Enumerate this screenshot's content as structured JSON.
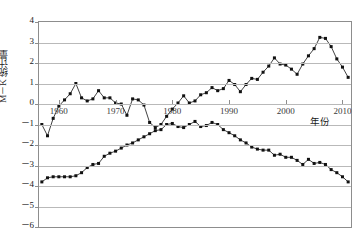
{
  "chart_data": {
    "type": "line",
    "title": "",
    "xlabel": "年份",
    "ylabel": "M－K 统计量",
    "xlim": [
      1956.5,
      2011.5
    ],
    "ylim": [
      -6,
      4
    ],
    "xticks": [
      1960,
      1970,
      1980,
      1990,
      2000,
      2010
    ],
    "xticklabels": [
      "1960",
      "1970",
      "1980",
      "1990",
      "2000",
      "2010"
    ],
    "yticks": [
      4,
      3,
      2,
      1,
      0,
      -1,
      -2,
      -3,
      -4,
      -5,
      -6
    ],
    "yticklabels": [
      "4",
      "3",
      "2",
      "1",
      "0",
      "－1",
      "－2",
      "－3",
      "－4",
      "－5",
      "－6"
    ],
    "grid": true,
    "grid_axis": "y",
    "legend": "none",
    "marker": "filled-square",
    "series": [
      {
        "name": "UF",
        "x": [
          1957,
          1958,
          1959,
          1960,
          1961,
          1962,
          1963,
          1964,
          1965,
          1966,
          1967,
          1968,
          1969,
          1970,
          1971,
          1972,
          1973,
          1974,
          1975,
          1976,
          1977,
          1978,
          1979,
          1980,
          1981,
          1982,
          1983,
          1984,
          1985,
          1986,
          1987,
          1988,
          1989,
          1990,
          1991,
          1992,
          1993,
          1994,
          1995,
          1996,
          1997,
          1998,
          1999,
          2000,
          2001,
          2002,
          2003,
          2004,
          2005,
          2006,
          2007,
          2008,
          2009,
          2010,
          2011
        ],
        "values": [
          -1.0,
          -1.55,
          -0.7,
          -0.1,
          0.5,
          0.55,
          1.0,
          0.35,
          0.15,
          0.2,
          0.65,
          0.3,
          0.3,
          0.05,
          0.1,
          -0.55,
          0.25,
          0.2,
          -0.1,
          -0.75,
          -1.0,
          -1.15,
          -1.1,
          -1.15,
          -1.2,
          -1.0,
          -1.1,
          -1.3,
          -1.45,
          -1.2,
          -1.05,
          -1.0,
          -0.85,
          -0.7,
          -0.55,
          -0.45,
          -0.35,
          -0.25,
          -0.2,
          -0.1,
          0.05,
          0.2,
          0.35,
          0.45,
          0.6,
          0.7,
          0.8,
          0.95,
          1.05,
          1.15,
          1.2,
          1.3,
          1.4,
          1.5,
          1.6
        ]
      },
      {
        "name": "UB",
        "x": [
          1957,
          1958,
          1959,
          1960,
          1961,
          1962,
          1963,
          1964,
          1965,
          1966,
          1967,
          1968,
          1969,
          1970,
          1971,
          1972,
          1973,
          1974,
          1975,
          1976,
          1977,
          1978,
          1979,
          1980,
          1981,
          1982,
          1983,
          1984,
          1985,
          1986,
          1987,
          1988,
          1989,
          1990,
          1991,
          1992,
          1993,
          1994,
          1995,
          1996,
          1997,
          1998,
          1999,
          2000,
          2001,
          2002,
          2003,
          2004,
          2005,
          2006,
          2007,
          2008,
          2009,
          2010,
          2011
        ],
        "values": [
          -3.8,
          -3.6,
          -3.55,
          -3.55,
          -3.55,
          -3.55,
          -3.5,
          -3.35,
          -3.1,
          -2.95,
          -2.9,
          -2.55,
          -2.4,
          -2.3,
          -2.15,
          -2.0,
          -1.9,
          -1.75,
          -1.6,
          -1.45,
          -1.3,
          -1.25,
          -1.0,
          -0.95,
          -1.1,
          -1.15,
          -1.0,
          -0.85,
          -1.1,
          -1.05,
          -0.9,
          -1.0,
          -1.25,
          -1.4,
          -1.55,
          -1.75,
          -1.9,
          -2.1,
          -2.2,
          -2.25,
          -2.25,
          -2.5,
          -2.45,
          -2.6,
          -2.6,
          -2.75,
          -2.95,
          -2.7,
          -2.9,
          -2.85,
          -2.95,
          -3.2,
          -3.35,
          -3.55,
          -3.8
        ]
      }
    ],
    "uf_points": [
      [
        1957,
        -1.0
      ],
      [
        1958,
        -1.55
      ],
      [
        1959,
        -0.7
      ],
      [
        1960,
        -0.1
      ],
      [
        1961,
        0.2
      ],
      [
        1962,
        0.5
      ],
      [
        1963,
        1.0
      ],
      [
        1964,
        0.3
      ],
      [
        1965,
        0.15
      ],
      [
        1966,
        0.25
      ],
      [
        1967,
        0.65
      ],
      [
        1968,
        0.3
      ],
      [
        1969,
        0.3
      ],
      [
        1970,
        0.05
      ],
      [
        1971,
        0.0
      ],
      [
        1972,
        -0.55
      ],
      [
        1973,
        0.25
      ],
      [
        1974,
        0.2
      ],
      [
        1975,
        -0.05
      ],
      [
        1976,
        -0.9
      ],
      [
        1977,
        -1.15
      ],
      [
        1978,
        -1.0
      ],
      [
        1979,
        -0.6
      ],
      [
        1980,
        -0.25
      ],
      [
        1981,
        0.05
      ],
      [
        1982,
        0.4
      ],
      [
        1983,
        0.05
      ],
      [
        1984,
        0.15
      ],
      [
        1985,
        0.45
      ],
      [
        1986,
        0.55
      ],
      [
        1987,
        0.8
      ],
      [
        1988,
        0.65
      ],
      [
        1989,
        0.75
      ],
      [
        1990,
        1.15
      ],
      [
        1991,
        0.95
      ],
      [
        1992,
        0.6
      ],
      [
        1993,
        0.95
      ],
      [
        1994,
        1.25
      ],
      [
        1995,
        1.2
      ],
      [
        1996,
        1.55
      ],
      [
        1997,
        1.85
      ],
      [
        1998,
        2.25
      ],
      [
        1999,
        1.95
      ],
      [
        2000,
        1.9
      ],
      [
        2001,
        1.7
      ],
      [
        2002,
        1.45
      ],
      [
        2003,
        1.95
      ],
      [
        2004,
        2.35
      ],
      [
        2005,
        2.7
      ],
      [
        2006,
        3.25
      ],
      [
        2007,
        3.2
      ],
      [
        2008,
        2.8
      ],
      [
        2009,
        2.2
      ],
      [
        2010,
        1.8
      ],
      [
        2011,
        1.3
      ]
    ],
    "annotations": []
  },
  "axes": {
    "y_title": "M－K 统计量",
    "x_title": "年份"
  }
}
